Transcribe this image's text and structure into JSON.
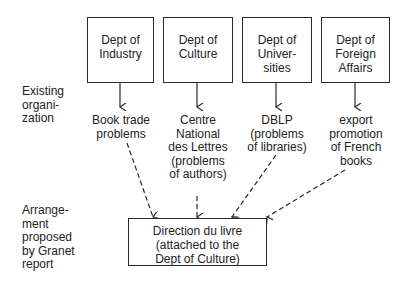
{
  "departments": [
    {
      "lines": [
        "Dept of",
        "Industry"
      ]
    },
    {
      "lines": [
        "Dept of",
        "Culture"
      ]
    },
    {
      "lines": [
        "Dept of",
        "Univer-",
        "sities"
      ]
    },
    {
      "lines": [
        "Dept of",
        "Foreign",
        "Affairs"
      ]
    }
  ],
  "outcomes": [
    {
      "lines": [
        "Book trade",
        "problems"
      ]
    },
    {
      "lines": [
        "Centre",
        "National",
        "des Lettres",
        "(problems",
        "of authors)"
      ]
    },
    {
      "lines": [
        "DBLP",
        "(problems",
        "of libraries)"
      ]
    },
    {
      "lines": [
        "export",
        "promotion",
        "of French",
        "books"
      ]
    }
  ],
  "side_labels": {
    "existing": [
      "Existing",
      "organi-",
      "zation"
    ],
    "proposed": [
      "Arrange-",
      "ment",
      "proposed",
      "by Granet",
      "report"
    ]
  },
  "target": {
    "lines": [
      "Direction du livre",
      "(attached to the",
      "Dept of Culture)"
    ]
  }
}
